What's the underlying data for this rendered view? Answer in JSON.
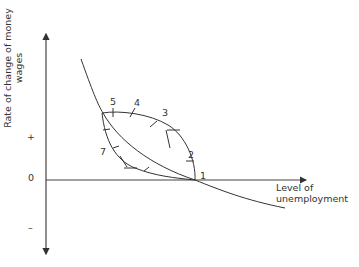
{
  "diagram": {
    "y_axis": {
      "label_line1": "Rate of change of  money",
      "label_line2": "wages",
      "plus": "+",
      "zero": "0",
      "minus": "–"
    },
    "x_axis": {
      "label_line1": "Level of",
      "label_line2": "unemployment"
    },
    "points": [
      {
        "id": "1",
        "label": "1"
      },
      {
        "id": "2",
        "label": "2"
      },
      {
        "id": "3",
        "label": "3"
      },
      {
        "id": "4",
        "label": "4"
      },
      {
        "id": "5",
        "label": "5"
      },
      {
        "id": "7",
        "label": "7"
      }
    ],
    "colors": {
      "line": "#333333",
      "text": "#333333",
      "background": "#ffffff"
    }
  }
}
